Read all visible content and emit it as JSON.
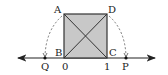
{
  "diagram": {
    "type": "geometry-number-line",
    "square": {
      "vertices": [
        "A",
        "B",
        "C",
        "D"
      ],
      "fill": "#c8c8c8",
      "stroke": "#333333",
      "diagonals": [
        "AC",
        "BD"
      ]
    },
    "number_line": {
      "ticks": [
        {
          "label": "0",
          "value": 0
        },
        {
          "label": "1",
          "value": 1
        }
      ],
      "points": [
        {
          "label": "Q",
          "note": "arc from A centered at C"
        },
        {
          "label": "P",
          "note": "arc from D centered at B"
        }
      ]
    },
    "labels": {
      "A": "A",
      "B": "B",
      "C": "C",
      "D": "D",
      "Q": "Q",
      "P": "P",
      "zero": "0",
      "one": "1"
    },
    "colors": {
      "line": "#222222",
      "square_fill": "#c8c8c8",
      "arc": "#555555"
    }
  }
}
